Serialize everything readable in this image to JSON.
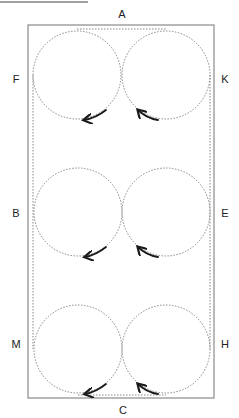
{
  "diagram": {
    "header_rule": {
      "x1": 0,
      "x2": 88,
      "y": 2
    },
    "field": {
      "x": 28,
      "y": 25,
      "width": 186,
      "height": 373,
      "stroke": "#8a8a8a"
    },
    "path_outline": {
      "left_x": 33,
      "right_x": 210,
      "top_y": 29,
      "bottom_y": 395,
      "stroke": "#8a8a8a"
    },
    "circle_radius": 44,
    "circles": [
      {
        "id": "top-left",
        "cx": 77,
        "cy": 75
      },
      {
        "id": "top-right",
        "cx": 166,
        "cy": 75
      },
      {
        "id": "middle-left",
        "cx": 78,
        "cy": 212
      },
      {
        "id": "middle-right",
        "cx": 166,
        "cy": 212
      },
      {
        "id": "bottom-left",
        "cx": 78,
        "cy": 349
      },
      {
        "id": "bottom-right",
        "cx": 166,
        "cy": 349
      }
    ],
    "arrows": [
      {
        "id": "top-left-arrow",
        "from": [
          106,
          110
        ],
        "ctrl": [
          96,
          118
        ],
        "to": [
          84,
          120
        ],
        "direction": "counterclockwise-left"
      },
      {
        "id": "top-right-arrow",
        "from": [
          158,
          120
        ],
        "ctrl": [
          146,
          118
        ],
        "to": [
          138,
          110
        ],
        "direction": "right-to-left-up"
      },
      {
        "id": "middle-left-arrow",
        "from": [
          106,
          247
        ],
        "ctrl": [
          96,
          255
        ],
        "to": [
          85,
          257
        ],
        "direction": "counterclockwise-left"
      },
      {
        "id": "middle-right-arrow",
        "from": [
          158,
          257
        ],
        "ctrl": [
          146,
          255
        ],
        "to": [
          138,
          247
        ],
        "direction": "right-to-left-up"
      },
      {
        "id": "bottom-left-arrow",
        "from": [
          106,
          384
        ],
        "ctrl": [
          96,
          392
        ],
        "to": [
          85,
          394
        ],
        "direction": "counterclockwise-left"
      },
      {
        "id": "bottom-right-arrow",
        "from": [
          158,
          394
        ],
        "ctrl": [
          146,
          392
        ],
        "to": [
          138,
          384
        ],
        "direction": "right-to-left-up"
      }
    ],
    "labels": [
      {
        "id": "A",
        "text": "A",
        "x": 122,
        "y": 14
      },
      {
        "id": "F",
        "text": "F",
        "x": 16,
        "y": 79
      },
      {
        "id": "K",
        "text": "K",
        "x": 225,
        "y": 79
      },
      {
        "id": "B",
        "text": "B",
        "x": 16,
        "y": 213
      },
      {
        "id": "E",
        "text": "E",
        "x": 225,
        "y": 213
      },
      {
        "id": "M",
        "text": "M",
        "x": 16,
        "y": 344
      },
      {
        "id": "H",
        "text": "H",
        "x": 225,
        "y": 344
      },
      {
        "id": "C",
        "text": "C",
        "x": 123,
        "y": 410
      }
    ],
    "colors": {
      "line": "#8a8a8a",
      "dotted": "#7a7a7a",
      "arrow": "#1a1a1a",
      "label": "#222222"
    }
  }
}
